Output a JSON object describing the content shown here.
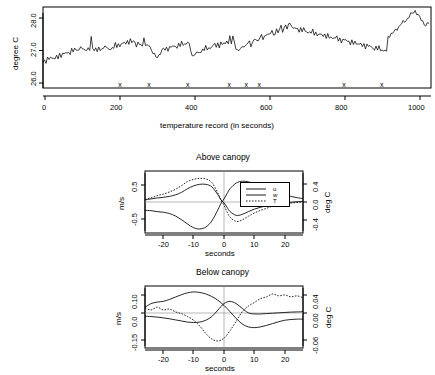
{
  "figure": {
    "panels": [
      {
        "id": "temperature-timeseries",
        "ylabel": "degree C",
        "xlabel": "temperature record (in seconds)",
        "yticks": [
          "26.0",
          "27.0",
          "28.0"
        ],
        "xticks": [
          "0",
          "200",
          "400",
          "600",
          "800",
          "1000"
        ],
        "marker_glyph": "x"
      },
      {
        "id": "above-canopy",
        "title": "Above canopy",
        "ylabel_left": "m/s",
        "ylabel_right": "deg C",
        "xlabel": "seconds",
        "yticks_left": [
          "-0.5",
          "0.5"
        ],
        "yticks_right": [
          "-0.4",
          "0.0",
          "0.4"
        ],
        "xticks": [
          "-20",
          "-10",
          "0",
          "10",
          "20"
        ],
        "legend": [
          {
            "label": "u",
            "style": "solid"
          },
          {
            "label": "w",
            "style": "solid"
          },
          {
            "label": "T",
            "style": "dotted"
          }
        ]
      },
      {
        "id": "below-canopy",
        "title": "Below canopy",
        "ylabel_left": "m/s",
        "ylabel_right": "deg C",
        "xlabel": "seconds",
        "yticks_left": [
          "-0.15",
          "0.0",
          "0.10"
        ],
        "yticks_right": [
          "-0.06",
          "0.00",
          "0.04"
        ],
        "xticks": [
          "-20",
          "-10",
          "0",
          "10",
          "20"
        ]
      }
    ]
  },
  "chart_data": [
    {
      "type": "line",
      "id": "temperature-timeseries",
      "title": "",
      "xlabel": "temperature record (in seconds)",
      "ylabel": "degree C",
      "xlim": [
        0,
        1030
      ],
      "ylim": [
        25.93,
        28.12
      ],
      "xticks": [
        0,
        200,
        400,
        600,
        800,
        1000
      ],
      "yticks": [
        26.0,
        27.0,
        28.0
      ],
      "grid": false,
      "event_markers_x": [
        205,
        282,
        385,
        495,
        540,
        575,
        800,
        900
      ],
      "event_marker_symbol": "x",
      "event_marker_y": 25.99,
      "series": [
        {
          "name": "air temperature",
          "x": [
            0,
            4,
            8,
            12,
            16,
            20,
            24,
            28,
            32,
            36,
            40,
            44,
            48,
            52,
            56,
            60,
            64,
            68,
            72,
            76,
            80,
            84,
            88,
            92,
            96,
            100,
            104,
            108,
            112,
            116,
            120,
            124,
            128,
            132,
            136,
            140,
            144,
            148,
            152,
            156,
            160,
            164,
            168,
            172,
            176,
            180,
            184,
            188,
            192,
            196,
            200,
            204,
            208,
            212,
            216,
            220,
            224,
            228,
            232,
            236,
            240,
            244,
            248,
            252,
            256,
            260,
            264,
            268,
            272,
            276,
            280,
            284,
            288,
            292,
            296,
            300,
            304,
            308,
            312,
            316,
            320,
            324,
            328,
            332,
            336,
            340,
            344,
            348,
            352,
            356,
            360,
            364,
            368,
            372,
            376,
            380,
            384,
            388,
            392,
            396,
            400,
            404,
            408,
            412,
            416,
            420,
            424,
            428,
            432,
            436,
            440,
            444,
            448,
            452,
            456,
            460,
            464,
            468,
            472,
            476,
            480,
            484,
            488,
            492,
            496,
            500,
            504,
            508,
            512,
            516,
            520,
            524,
            528,
            532,
            536,
            540,
            544,
            548,
            552,
            556,
            560,
            564,
            568,
            572,
            576,
            580,
            584,
            588,
            592,
            596,
            600,
            604,
            608,
            612,
            616,
            620,
            624,
            628,
            632,
            636,
            640,
            644,
            648,
            652,
            656,
            660,
            664,
            668,
            672,
            676,
            680,
            684,
            688,
            692,
            696,
            700,
            704,
            708,
            712,
            716,
            720,
            724,
            728,
            732,
            736,
            740,
            744,
            748,
            752,
            756,
            760,
            764,
            768,
            772,
            776,
            780,
            784,
            788,
            792,
            796,
            800,
            804,
            808,
            812,
            816,
            820,
            824,
            828,
            832,
            836,
            840,
            844,
            848,
            852,
            856,
            860,
            864,
            868,
            872,
            876,
            880,
            884,
            888,
            892,
            896,
            900,
            904,
            908,
            912,
            916,
            920,
            924,
            928,
            932,
            936,
            940,
            944,
            948,
            952,
            956,
            960,
            964,
            968,
            972,
            976,
            980,
            984,
            988,
            992,
            996,
            1000,
            1004,
            1008,
            1012,
            1016,
            1020,
            1024
          ],
          "y": [
            26.62,
            26.7,
            26.66,
            26.74,
            26.68,
            26.76,
            26.7,
            26.78,
            26.72,
            26.8,
            26.74,
            26.84,
            26.78,
            26.88,
            26.82,
            26.9,
            26.86,
            26.92,
            26.88,
            26.96,
            26.9,
            26.98,
            26.94,
            27.02,
            26.96,
            27.05,
            26.98,
            26.93,
            26.99,
            26.95,
            27.02,
            26.97,
            27.28,
            27.02,
            26.95,
            26.99,
            26.93,
            27.0,
            26.95,
            27.04,
            26.98,
            27.08,
            27.0,
            26.96,
            27.02,
            26.97,
            27.06,
            27.0,
            27.1,
            27.04,
            27.12,
            27.06,
            27.16,
            27.1,
            27.18,
            27.12,
            27.2,
            27.14,
            27.22,
            27.15,
            27.24,
            27.17,
            27.08,
            27.14,
            27.06,
            27.12,
            27.05,
            27.34,
            27.1,
            27.05,
            27.08,
            27.02,
            26.96,
            26.9,
            26.84,
            26.78,
            26.74,
            26.82,
            26.88,
            26.94,
            27.0,
            26.96,
            27.02,
            26.98,
            27.04,
            27.0,
            27.06,
            27.02,
            27.1,
            27.04,
            27.12,
            27.06,
            27.14,
            27.08,
            27.16,
            27.1,
            27.2,
            27.12,
            26.92,
            26.84,
            26.78,
            26.84,
            26.9,
            26.86,
            26.94,
            26.9,
            26.98,
            26.94,
            27.02,
            26.98,
            27.05,
            27.0,
            27.08,
            27.03,
            27.12,
            27.05,
            27.14,
            27.06,
            27.16,
            27.08,
            27.18,
            27.1,
            27.22,
            27.12,
            27.3,
            27.16,
            27.34,
            27.2,
            27.0,
            26.9,
            26.94,
            27.0,
            27.06,
            27.1,
            27.02,
            27.08,
            27.14,
            27.18,
            27.1,
            27.16,
            27.22,
            27.26,
            27.18,
            27.24,
            27.3,
            27.34,
            27.26,
            27.32,
            27.38,
            27.42,
            27.34,
            27.4,
            27.46,
            27.36,
            27.44,
            27.52,
            27.42,
            27.5,
            27.58,
            27.48,
            27.56,
            27.64,
            27.54,
            27.62,
            27.7,
            27.6,
            27.52,
            27.58,
            27.5,
            27.56,
            27.48,
            27.54,
            27.46,
            27.52,
            27.44,
            27.5,
            27.42,
            27.48,
            27.4,
            27.46,
            27.38,
            27.44,
            27.36,
            27.42,
            27.34,
            27.4,
            27.32,
            27.38,
            27.3,
            27.36,
            27.28,
            27.34,
            27.26,
            27.32,
            27.24,
            27.3,
            27.22,
            27.28,
            27.2,
            27.26,
            27.18,
            27.24,
            27.16,
            27.22,
            27.14,
            27.2,
            27.12,
            27.18,
            27.1,
            27.16,
            27.08,
            27.14,
            27.06,
            27.12,
            27.04,
            27.1,
            27.02,
            27.08,
            27.0,
            27.06,
            26.98,
            27.04,
            26.96,
            27.02,
            26.94,
            27.0,
            26.92,
            26.98,
            26.9,
            27.3,
            27.34,
            27.38,
            27.42,
            27.46,
            27.5,
            27.54,
            27.58,
            27.62,
            27.66,
            27.7,
            27.74,
            27.78,
            27.82,
            27.86,
            27.9,
            27.94,
            27.98,
            28.02,
            27.96,
            27.9,
            27.84,
            27.78,
            27.72,
            27.66,
            27.6,
            27.66,
            27.72,
            27.78,
            27.84
          ]
        }
      ]
    },
    {
      "type": "line",
      "id": "above-canopy",
      "title": "Above canopy",
      "xlabel": "seconds",
      "ylabel_left": "m/s",
      "ylabel_right": "deg C",
      "xlim": [
        -26,
        26
      ],
      "ylim_left": [
        -1.05,
        0.95
      ],
      "ylim_right": [
        -0.62,
        0.56
      ],
      "yticks_left": [
        -0.5,
        0.5
      ],
      "yticks_right": [
        -0.4,
        0.0,
        0.4
      ],
      "xticks": [
        -20,
        -10,
        0,
        10,
        20
      ],
      "grid": false,
      "legend_position": "center-right",
      "x": [
        -26,
        -24,
        -22,
        -20,
        -18,
        -16,
        -14,
        -12,
        -10,
        -8,
        -6,
        -4,
        -2,
        -1,
        0,
        1,
        2,
        4,
        6,
        8,
        10,
        12,
        14,
        16,
        18,
        20,
        22,
        24,
        26
      ],
      "series": [
        {
          "name": "u",
          "style": "solid",
          "axis": "left",
          "values": [
            0.02,
            0.05,
            0.08,
            0.1,
            0.13,
            0.18,
            0.26,
            0.38,
            0.47,
            0.52,
            0.52,
            0.44,
            0.18,
            0.02,
            -0.08,
            -0.22,
            -0.36,
            -0.48,
            -0.45,
            -0.36,
            -0.28,
            -0.22,
            -0.17,
            -0.13,
            -0.1,
            -0.08,
            -0.06,
            -0.04,
            -0.03
          ]
        },
        {
          "name": "w",
          "style": "solid",
          "axis": "left",
          "values": [
            -0.32,
            -0.33,
            -0.36,
            -0.38,
            -0.42,
            -0.5,
            -0.62,
            -0.76,
            -0.88,
            -0.92,
            -0.86,
            -0.66,
            -0.3,
            -0.1,
            0.05,
            0.22,
            0.38,
            0.56,
            0.62,
            0.6,
            0.54,
            0.46,
            0.38,
            0.3,
            0.24,
            0.18,
            0.13,
            0.09,
            0.06
          ]
        },
        {
          "name": "T",
          "style": "dotted",
          "axis": "right",
          "values": [
            0.02,
            0.05,
            0.09,
            0.12,
            0.16,
            0.21,
            0.28,
            0.36,
            0.4,
            0.42,
            0.41,
            0.34,
            0.14,
            0.01,
            -0.09,
            -0.22,
            -0.32,
            -0.4,
            -0.37,
            -0.3,
            -0.24,
            -0.19,
            -0.15,
            -0.11,
            -0.09,
            -0.07,
            -0.05,
            -0.04,
            -0.03
          ]
        }
      ]
    },
    {
      "type": "line",
      "id": "below-canopy",
      "title": "Below canopy",
      "xlabel": "seconds",
      "ylabel_left": "m/s",
      "ylabel_right": "deg C",
      "xlim": [
        -26,
        26
      ],
      "ylim_left": [
        -0.2,
        0.135
      ],
      "ylim_right": [
        -0.077,
        0.055
      ],
      "yticks_left": [
        -0.15,
        0.0,
        0.1
      ],
      "yticks_right": [
        -0.06,
        0.0,
        0.04
      ],
      "xticks": [
        -20,
        -10,
        0,
        10,
        20
      ],
      "grid": false,
      "x": [
        -26,
        -24,
        -22,
        -20,
        -18,
        -16,
        -14,
        -12,
        -10,
        -8,
        -6,
        -4,
        -2,
        0,
        2,
        4,
        6,
        8,
        10,
        12,
        14,
        16,
        18,
        20,
        22,
        24,
        26
      ],
      "series": [
        {
          "name": "u",
          "style": "solid",
          "axis": "left",
          "values": [
            0.02,
            0.04,
            0.048,
            0.052,
            0.062,
            0.075,
            0.088,
            0.098,
            0.103,
            0.1,
            0.092,
            0.078,
            0.058,
            0.03,
            -0.004,
            -0.04,
            -0.07,
            -0.086,
            -0.09,
            -0.086,
            -0.078,
            -0.068,
            -0.058,
            -0.05,
            -0.046,
            -0.044,
            -0.044
          ]
        },
        {
          "name": "w",
          "style": "solid",
          "axis": "left",
          "values": [
            -0.028,
            -0.03,
            -0.033,
            -0.037,
            -0.042,
            -0.048,
            -0.054,
            -0.06,
            -0.062,
            -0.06,
            -0.05,
            -0.03,
            0.005,
            0.04,
            0.052,
            0.04,
            0.014,
            -0.01,
            -0.016,
            -0.016,
            -0.014,
            -0.012,
            -0.01,
            -0.008,
            -0.006,
            -0.005,
            -0.004
          ]
        },
        {
          "name": "T",
          "style": "dotted",
          "axis": "right",
          "values": [
            0.008,
            0.004,
            0.01,
            0.004,
            0.006,
            0.0,
            -0.004,
            -0.01,
            -0.018,
            -0.03,
            -0.046,
            -0.058,
            -0.062,
            -0.056,
            -0.04,
            -0.02,
            0.0,
            0.012,
            0.02,
            0.028,
            0.032,
            0.038,
            0.034,
            0.036,
            0.032,
            0.034,
            0.03
          ]
        }
      ]
    }
  ]
}
